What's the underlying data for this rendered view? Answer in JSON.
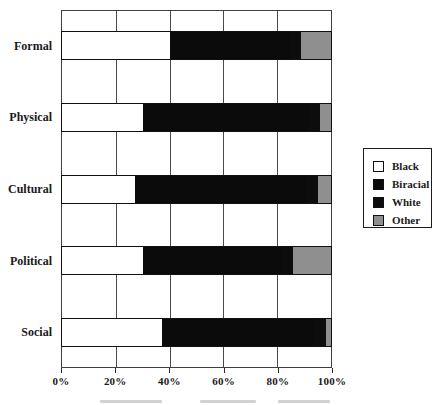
{
  "figure": {
    "background": "#ffffff",
    "line_color": "#3f3f3f"
  },
  "chart_data": {
    "type": "bar",
    "orientation": "horizontal",
    "stacked": true,
    "stacked_100_percent": true,
    "title": "",
    "xlabel": "",
    "ylabel": "",
    "categories": [
      "Formal",
      "Physical",
      "Cultural",
      "Political",
      "Social"
    ],
    "series": [
      {
        "name": "Black",
        "color": "#ffffff",
        "values": [
          40,
          30,
          27,
          30,
          37
        ]
      },
      {
        "name": "Biracial",
        "color": "#0b0b0b",
        "values": [
          45,
          62,
          64,
          52,
          57
        ]
      },
      {
        "name": "White",
        "color": "#0d0d0d",
        "values": [
          4,
          4,
          4,
          4,
          4
        ]
      },
      {
        "name": "Other",
        "color": "#8f8f8f",
        "values": [
          11,
          4,
          5,
          14,
          2
        ]
      }
    ],
    "x_axis": {
      "min": 0,
      "max": 100,
      "unit": "%",
      "tick_interval": 20,
      "tick_labels": [
        "0%",
        "20%",
        "40%",
        "60%",
        "80%",
        "100%"
      ]
    },
    "grid": {
      "vertical": true,
      "horizontal": false,
      "interval_percent": 20
    },
    "legend": {
      "position": "right",
      "border": true,
      "entries": [
        "Black",
        "Biracial",
        "White",
        "Other"
      ]
    }
  }
}
